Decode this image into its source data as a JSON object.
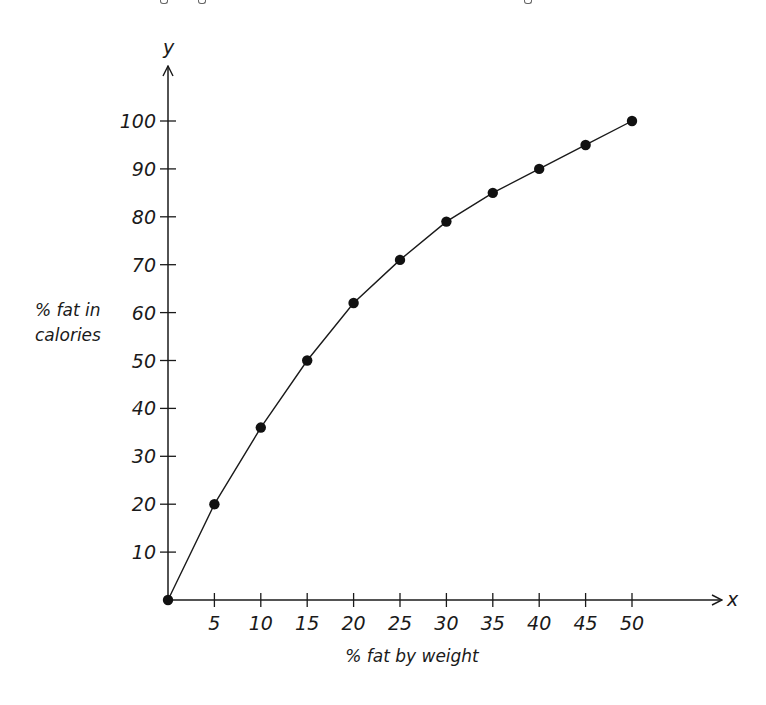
{
  "chart_data": {
    "type": "line",
    "title": "",
    "xlabel": "% fat by weight",
    "ylabel": [
      "% fat in",
      "calories"
    ],
    "x_axis_var": "x",
    "y_axis_var": "y",
    "xlim": [
      0,
      50
    ],
    "ylim": [
      0,
      100
    ],
    "x_ticks": [
      5,
      10,
      15,
      20,
      25,
      30,
      35,
      40,
      45,
      50
    ],
    "y_ticks": [
      10,
      20,
      30,
      40,
      50,
      60,
      70,
      80,
      90,
      100
    ],
    "grid": false,
    "legend": null,
    "markers": "filled-circle",
    "series": [
      {
        "name": "% fat in calories",
        "x": [
          0,
          5,
          10,
          15,
          20,
          25,
          30,
          35,
          40,
          45,
          50
        ],
        "y": [
          0,
          20,
          36,
          50,
          62,
          71,
          79,
          85,
          90,
          95,
          100
        ]
      }
    ]
  },
  "style": {
    "line_color": "#1a1a1a",
    "marker_color": "#111111",
    "axis_color": "#1a1a1a"
  },
  "layout": {
    "origin_px": [
      168,
      600
    ],
    "x_px_per_unit": 9.28,
    "y_px_per_unit": 4.79,
    "x_axis_end_px": 722,
    "y_axis_end_px": 66
  }
}
